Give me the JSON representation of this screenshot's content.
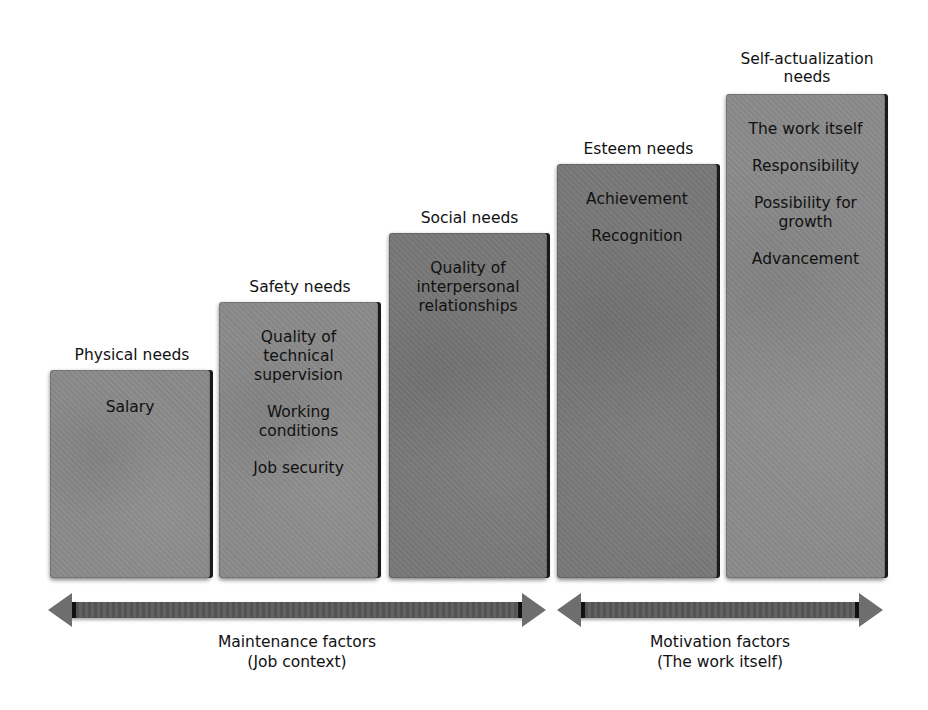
{
  "diagram": {
    "type": "staircase",
    "steps": [
      {
        "label": "Physical needs",
        "items": [
          "Salary"
        ]
      },
      {
        "label": "Safety needs",
        "items": [
          "Quality of technical supervision",
          "Working conditions",
          "Job security"
        ]
      },
      {
        "label": "Social needs",
        "items": [
          "Quality of interpersonal relationships"
        ]
      },
      {
        "label": "Esteem needs",
        "items": [
          "Achievement",
          "Recognition"
        ]
      },
      {
        "label": "Self-actualization needs",
        "items": [
          "The work itself",
          "Responsibility",
          "Possibility for growth",
          "Advancement"
        ]
      }
    ],
    "factors": [
      {
        "title": "Maintenance factors",
        "subtitle": "(Job context)",
        "spans_steps": [
          0,
          1,
          2
        ]
      },
      {
        "title": "Motivation factors",
        "subtitle": "(The work itself)",
        "spans_steps": [
          3,
          4
        ]
      }
    ],
    "colors": {
      "step_fill": "#8a8a8a",
      "step_shadow": "#1a1a1a",
      "arrow_fill": "#5a5a5a",
      "text": "#111111",
      "background": "#ffffff"
    }
  }
}
